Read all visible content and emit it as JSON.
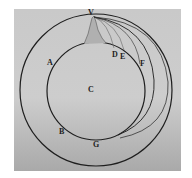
{
  "diagram": {
    "colors": {
      "background": "#ffffff",
      "plate": "#c9c9c9",
      "ink": "#1e1e1e"
    },
    "labels": {
      "V": "V",
      "A": "A",
      "B": "B",
      "C": "C",
      "D": "D",
      "E": "E",
      "F": "F",
      "G": "G"
    },
    "shapes": {
      "earth_circle": {
        "cx": 96,
        "cy": 90,
        "r": 49
      },
      "outer_orbit": {
        "cx": 96,
        "cy": 90,
        "r": 76
      },
      "launch_point": {
        "x": 93,
        "y": 16
      }
    }
  }
}
